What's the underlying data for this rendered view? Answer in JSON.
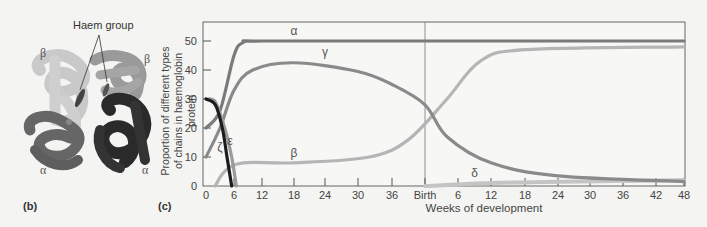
{
  "panel_b": {
    "letter": "(b)",
    "callout": "Haem group",
    "subunit_labels": [
      "β",
      "β",
      "α",
      "α"
    ]
  },
  "panel_c": {
    "letter": "(c)"
  },
  "chart_data": {
    "type": "line",
    "title": "",
    "xlabel": "Weeks of development",
    "ylabel": "Proportion of different types of chains in haemoglobin protein",
    "x_ticks": [
      "0",
      "6",
      "12",
      "18",
      "24",
      "30",
      "36",
      "Birth",
      "6",
      "12",
      "18",
      "24",
      "30",
      "36",
      "42",
      "48"
    ],
    "y_ticks": [
      "0",
      "10",
      "20",
      "30",
      "40",
      "50"
    ],
    "ylim": [
      0,
      55
    ],
    "xlim_desc": "0 weeks gestation to 48 weeks postnatal (Birth at ~40 weeks gestation)",
    "x_positions_weeks_from_conception": [
      0,
      6,
      12,
      18,
      24,
      30,
      36,
      40,
      46,
      52,
      58,
      64,
      70,
      76,
      82,
      88
    ],
    "grid": false,
    "annotations": [
      "Birth vertical line"
    ],
    "series": [
      {
        "name": "α",
        "color": "#7a7a7a",
        "points": [
          [
            0,
            20
          ],
          [
            3,
            26
          ],
          [
            6,
            45
          ],
          [
            8,
            49.5
          ],
          [
            12,
            50
          ],
          [
            40,
            50
          ],
          [
            88,
            50
          ]
        ]
      },
      {
        "name": "γ",
        "color": "#8a8a8a",
        "points": [
          [
            0,
            10
          ],
          [
            3,
            20
          ],
          [
            6,
            33
          ],
          [
            10,
            40
          ],
          [
            18,
            42.5
          ],
          [
            30,
            39.5
          ],
          [
            36,
            35
          ],
          [
            40,
            28
          ],
          [
            44,
            17
          ],
          [
            52,
            8
          ],
          [
            64,
            3.5
          ],
          [
            88,
            1.5
          ]
        ]
      },
      {
        "name": "β",
        "color": "#b5b5b5",
        "points": [
          [
            2,
            0
          ],
          [
            4,
            5
          ],
          [
            8,
            8
          ],
          [
            18,
            8
          ],
          [
            32,
            10
          ],
          [
            38,
            16
          ],
          [
            44,
            30
          ],
          [
            50,
            43
          ],
          [
            58,
            47
          ],
          [
            88,
            48
          ]
        ]
      },
      {
        "name": "ε",
        "color": "#9a9a9a",
        "points": [
          [
            0,
            30
          ],
          [
            2,
            29
          ],
          [
            4,
            20
          ],
          [
            5.5,
            10
          ],
          [
            6.5,
            0
          ]
        ]
      },
      {
        "name": "ζ",
        "color": "#1c1c1c",
        "points": [
          [
            0,
            30
          ],
          [
            2,
            28
          ],
          [
            3.5,
            20
          ],
          [
            4.5,
            10
          ],
          [
            5.5,
            0
          ]
        ]
      },
      {
        "name": "δ",
        "color": "#c4c4c4",
        "points": [
          [
            40,
            0
          ],
          [
            52,
            1
          ],
          [
            64,
            1.5
          ],
          [
            88,
            2
          ]
        ]
      }
    ],
    "series_labels": [
      {
        "name": "α",
        "x": 18,
        "y": 52
      },
      {
        "name": "γ",
        "x": 24,
        "y": 45
      },
      {
        "name": "β",
        "x": 18,
        "y": 10
      },
      {
        "name": "ε",
        "x": 5.2,
        "y": 14
      },
      {
        "name": "ζ",
        "x": 3.0,
        "y": 12
      },
      {
        "name": "δ",
        "x": 49,
        "y": 3
      }
    ]
  }
}
